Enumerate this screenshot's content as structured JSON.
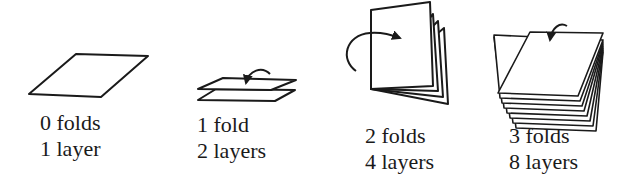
{
  "diagram": {
    "stages": [
      {
        "folds_label": "0 folds",
        "layers_label": "1 layer"
      },
      {
        "folds_label": "1 fold",
        "layers_label": "2 layers"
      },
      {
        "folds_label": "2 folds",
        "layers_label": "4 layers"
      },
      {
        "folds_label": "3 folds",
        "layers_label": "8 layers"
      }
    ],
    "colors": {
      "stroke": "#1a1a1a",
      "background": "#ffffff"
    }
  }
}
